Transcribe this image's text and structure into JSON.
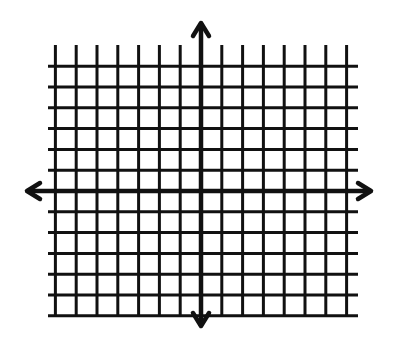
{
  "diagram": {
    "type": "coordinate-plane",
    "ink_color": "#111111",
    "background_color": "#ffffff",
    "grid": {
      "vertical_lines_left_of_axis": 7,
      "vertical_lines_right_of_axis": 7,
      "horizontal_lines_above_axis": 6,
      "horizontal_lines_below_axis": 6
    },
    "axes": {
      "x_axis": {
        "arrows": [
          "left",
          "right"
        ]
      },
      "y_axis": {
        "arrows": [
          "up",
          "down"
        ]
      }
    },
    "labels": []
  }
}
